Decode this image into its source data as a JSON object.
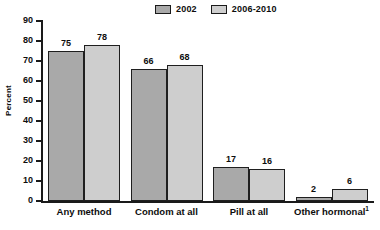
{
  "chart_data": {
    "type": "bar",
    "title": "",
    "subtitle": "",
    "xlabel": "",
    "ylabel": "Percent",
    "ylim": [
      0,
      90
    ],
    "ytick_step": 10,
    "yticks": [
      0,
      10,
      20,
      30,
      40,
      50,
      60,
      70,
      80,
      90
    ],
    "ytick_labels": [
      "0",
      "10",
      "20",
      "30",
      "40",
      "50",
      "60",
      "70",
      "80",
      "90"
    ],
    "grid": false,
    "legend_position": "top-center",
    "categories": [
      "Any method",
      "Condom at all",
      "Pill at all",
      "Other hormonal"
    ],
    "category_footnote_marks": [
      "",
      "",
      "",
      "1"
    ],
    "series": [
      {
        "name": "2002",
        "color": "#a9a9a9",
        "values": [
          75,
          66,
          17,
          2
        ]
      },
      {
        "name": "2006-2010",
        "color": "#cecece",
        "values": [
          78,
          68,
          16,
          6
        ]
      }
    ],
    "value_labels": [
      [
        "75",
        "66",
        "17",
        "2"
      ],
      [
        "78",
        "68",
        "16",
        "6"
      ]
    ],
    "annotations": []
  },
  "legend": {
    "entries": [
      {
        "label": "2002"
      },
      {
        "label": "2006-2010"
      }
    ]
  },
  "axes": {
    "y_title": "Percent"
  }
}
